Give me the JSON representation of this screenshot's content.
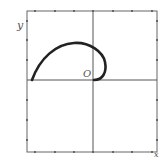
{
  "diagram": {
    "type": "polar-curve-plot",
    "labels": {
      "y_axis": "y",
      "x_axis": "x",
      "origin": "O"
    },
    "frame": {
      "x0": 27,
      "y0": 11,
      "x1": 157,
      "y1": 152
    },
    "axes": {
      "vertical_x": 93,
      "horizontal_y": 80
    },
    "ticks": {
      "top_x": [
        35,
        55,
        74,
        93,
        113,
        132,
        152
      ],
      "bottom_x": [
        35,
        55,
        74,
        93,
        113,
        132,
        152
      ],
      "left_y": [
        21,
        40,
        60,
        80,
        100,
        120,
        140
      ],
      "right_y": [
        21,
        40,
        60,
        80,
        100,
        120,
        140
      ]
    },
    "curve": {
      "description": "Thick curve starting on the negative x-axis, arcing up and over to the right, then curling down into the origin",
      "color": "#222222"
    },
    "colors": {
      "line": "#555555",
      "curve": "#222222",
      "background": "#ffffff"
    }
  }
}
